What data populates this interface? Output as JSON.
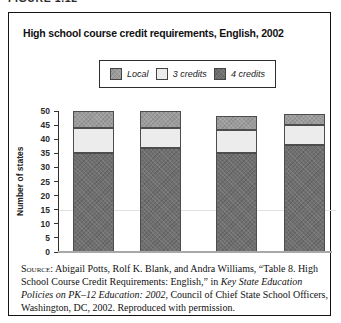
{
  "figure_label": "FIGURE 1.12",
  "title": "High school course credit requirements, English, 2002",
  "colors": {
    "local": "#9c9c9c",
    "credits3": "#ececec",
    "credits4": "#6f6f6f",
    "axis_baseline": "#a8a8a8",
    "box_border": "#141414"
  },
  "legend": [
    {
      "label": "Local",
      "key": "local"
    },
    {
      "label": "3 credits",
      "key": "credits3"
    },
    {
      "label": "4 credits",
      "key": "credits4"
    }
  ],
  "chart_data": {
    "type": "bar",
    "stacked": true,
    "title": "High school course credit requirements, English, 2002",
    "xlabel": "",
    "ylabel": "Number of states",
    "ylim": [
      0,
      50
    ],
    "ytick_step": 5,
    "grid": "single faint horizontal line at y=15",
    "legend_position": "top-center",
    "categories": [
      "",
      "",
      "",
      ""
    ],
    "series": [
      {
        "name": "4 credits",
        "key": "credits4",
        "values": [
          35,
          37,
          35,
          38
        ]
      },
      {
        "name": "3 credits",
        "key": "credits3",
        "values": [
          9,
          7,
          8,
          7
        ]
      },
      {
        "name": "Local",
        "key": "local",
        "values": [
          6,
          6,
          5,
          4
        ]
      }
    ],
    "bar_totals": [
      50,
      50,
      48,
      49
    ]
  },
  "source": {
    "label": "Source:",
    "text_before_italic": " Abigail Potts, Rolf K. Blank, and Andra Williams, “Table 8. High School Course Credit Requirements: English,” in ",
    "italic": "Key State Education Policies on PK–12 Education: 2002",
    "text_after_italic": ", Council of Chief State School Officers, Washington, DC, 2002. Reproduced with permission."
  }
}
